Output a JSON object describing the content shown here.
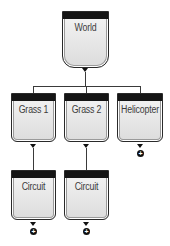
{
  "diagram": {
    "type": "tree",
    "root": {
      "label": "World",
      "children": [
        {
          "label": "Grass 1",
          "children": [
            {
              "label": "Circuit",
              "children": [],
              "add_child": true
            }
          ]
        },
        {
          "label": "Grass 2",
          "children": [
            {
              "label": "Circuit",
              "children": [],
              "add_child": true
            }
          ]
        },
        {
          "label": "Helicopter",
          "children": [],
          "add_child": true
        }
      ]
    },
    "nodes": {
      "world": "World",
      "grass1": "Grass 1",
      "grass2": "Grass 2",
      "helicopter": "Helicopter",
      "circuit1": "Circuit",
      "circuit2": "Circuit"
    },
    "icons": {
      "expand": "triangle-down-icon",
      "add": "plus-circle-icon",
      "plus_glyph": "+"
    },
    "colors": {
      "header_bar": "#151515",
      "node_fill": "#e6e6e6",
      "connector": "#3a3a3a"
    }
  }
}
